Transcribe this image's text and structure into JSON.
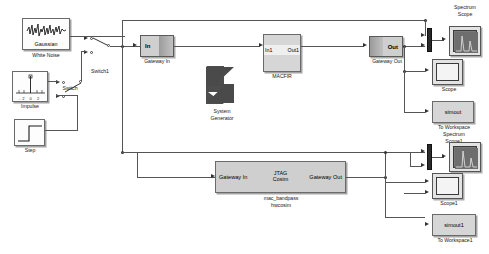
{
  "diagram": {
    "background": "#ffffff",
    "wire_color": "#555555"
  },
  "sources": {
    "gaussian": {
      "inner_label": "Gaussian",
      "caption": "White Noise",
      "icon": "noise-waveform-icon"
    },
    "impulse": {
      "caption": "Impulse",
      "icon": "impulse-waveform-icon",
      "axis_ticks": "-2 0 2"
    },
    "step": {
      "caption": "Step",
      "icon": "step-waveform-icon"
    }
  },
  "switches": {
    "switch1": {
      "caption": "Switch1"
    },
    "switch": {
      "caption": "Switch"
    }
  },
  "gateways": {
    "gateway_in": {
      "port_label": "In",
      "caption": "Gateway In"
    },
    "gateway_out": {
      "port_label": "Out",
      "caption": "Gateway Out"
    }
  },
  "sysgen": {
    "line1": "System",
    "line2": "Generator",
    "icon": "xilinx-logo-icon"
  },
  "macfir": {
    "in_port": "In1",
    "out_port": "Out1",
    "caption": "MACFIR"
  },
  "hwcosim": {
    "in_port": "Gateway In",
    "out_port": "Gateway Out",
    "center_line1": "JTAG",
    "center_line2": "Cosim",
    "caption_line1": "mac_bandpass",
    "caption_line2": "hwcosim"
  },
  "sinks": {
    "spectrum_scope_top": {
      "caption_line1": "Spectrum",
      "caption_line2": "Scope"
    },
    "scope_top": {
      "caption": "Scope"
    },
    "to_workspace_top": {
      "block_label": "simout",
      "caption_line1": "To Workspace",
      "caption_line2": "Spectrum",
      "caption_line3": "Scope1"
    },
    "scope_bottom": {
      "caption": "Scope1"
    },
    "to_workspace_bottom": {
      "block_label": "simout1",
      "caption": "To Workspace1"
    }
  }
}
